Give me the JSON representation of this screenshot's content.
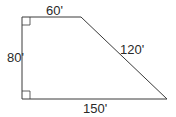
{
  "diagram": {
    "shape": "right trapezoid",
    "stroke_color": "#3a3a3a",
    "vertices": {
      "top_left": [
        22,
        17
      ],
      "top_right": [
        81,
        17
      ],
      "bottom_right": [
        167,
        99
      ],
      "bottom_left": [
        22,
        99
      ]
    },
    "labels": {
      "top": "60'",
      "left": "80'",
      "slant": "120'",
      "bottom": "150'"
    },
    "right_angle_markers": [
      "top_left",
      "bottom_left"
    ]
  }
}
